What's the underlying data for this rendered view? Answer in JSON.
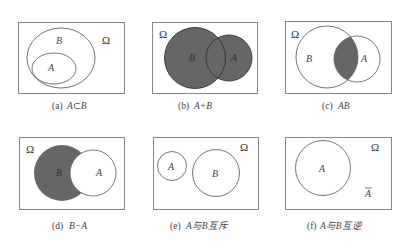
{
  "figure": {
    "shade_color": "#666666",
    "panels": [
      {
        "id": "a",
        "labels": {
          "outer": "B",
          "inner": "A",
          "universe": "Ω"
        },
        "caption": {
          "prefix": "(a)",
          "expr": "A⊂B"
        }
      },
      {
        "id": "b",
        "labels": {
          "left": "B",
          "right": "A",
          "universe": "Ω"
        },
        "caption": {
          "prefix": "(b)",
          "expr": "A+B"
        }
      },
      {
        "id": "c",
        "labels": {
          "left": "B",
          "right": "A",
          "universe": "Ω"
        },
        "caption": {
          "prefix": "(c)",
          "expr": "AB"
        }
      },
      {
        "id": "d",
        "labels": {
          "left": "B",
          "right": "A",
          "universe": "Ω"
        },
        "caption": {
          "prefix": "(d)",
          "expr": "B−A"
        }
      },
      {
        "id": "e",
        "labels": {
          "left": "A",
          "right": "B",
          "universe": "Ω"
        },
        "caption": {
          "prefix": "(e)",
          "expr": "A与B互斥"
        }
      },
      {
        "id": "f",
        "labels": {
          "circle": "A",
          "complement": "A",
          "universe": "Ω"
        },
        "caption": {
          "prefix": "(f)",
          "expr": "A与B互逆"
        }
      }
    ]
  }
}
